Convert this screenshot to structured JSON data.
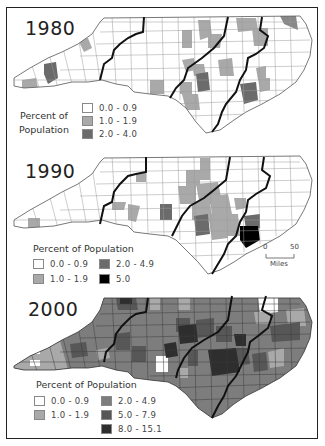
{
  "maps": [
    {
      "year": "1980",
      "legend_title_line1": "Percent of",
      "legend_title_line2": "Population",
      "classes": [
        {
          "label": "0.0 - 0.9",
          "color": "#ffffff"
        },
        {
          "label": "1.0 - 1.9",
          "color": "#a9a9a9"
        },
        {
          "label": "2.0 - 4.0",
          "color": "#6b6b6b"
        }
      ]
    },
    {
      "year": "1990",
      "legend_title": "Percent of Population",
      "classes": [
        {
          "label": "0.0 - 0.9",
          "color": "#ffffff"
        },
        {
          "label": "1.0 - 1.9",
          "color": "#a9a9a9"
        },
        {
          "label": "2.0 - 4.9",
          "color": "#6b6b6b"
        },
        {
          "label": "5.0",
          "color": "#000000"
        }
      ],
      "scale_bar": {
        "start": "0",
        "end": "50",
        "unit": "Miles"
      }
    },
    {
      "year": "2000",
      "legend_title": "Percent of Population",
      "classes": [
        {
          "label": "0.0 - 0.9",
          "color": "#ffffff"
        },
        {
          "label": "1.0 - 1.9",
          "color": "#a9a9a9"
        },
        {
          "label": "2.0 - 4.9",
          "color": "#7d7d7d"
        },
        {
          "label": "5.0 - 7.9",
          "color": "#575757"
        },
        {
          "label": "8.0 - 15.1",
          "color": "#2e2e2e"
        }
      ]
    }
  ]
}
